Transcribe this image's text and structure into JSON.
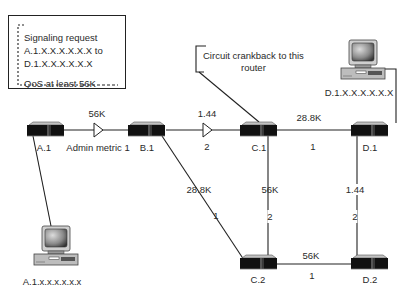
{
  "signal_box": {
    "line1": "Signaling request",
    "line2": "A.1.X.X.X.X.X.X to",
    "line3": "D.1.X.X.X.X.X.X",
    "line4": "QoS at least 56K"
  },
  "callout": {
    "line1": "Circuit crankback to this",
    "line2": "router"
  },
  "routers": [
    {
      "id": "A.1",
      "label": "A.1"
    },
    {
      "id": "B.1",
      "label": "B.1"
    },
    {
      "id": "C.1",
      "label": "C.1"
    },
    {
      "id": "D.1",
      "label": "D.1"
    },
    {
      "id": "C.2",
      "label": "C.2"
    },
    {
      "id": "D.2",
      "label": "D.2"
    }
  ],
  "hosts": [
    {
      "id": "host-d1",
      "label": "D.1.X.X.X.X.X.X",
      "attached_to": "D.1"
    },
    {
      "id": "host-a1",
      "label": "A.1.x.x.x.x.x.x",
      "attached_to": "A.1"
    }
  ],
  "links": [
    {
      "from": "A.1",
      "to": "B.1",
      "bandwidth": "56K",
      "metric": "Admin metric 1"
    },
    {
      "from": "B.1",
      "to": "C.1",
      "bandwidth": "1.44",
      "metric": "2"
    },
    {
      "from": "C.1",
      "to": "D.1",
      "bandwidth": "28.8K",
      "metric": "1"
    },
    {
      "from": "B.1",
      "to": "C.2",
      "bandwidth": "28.8K",
      "metric": "1"
    },
    {
      "from": "C.1",
      "to": "C.2",
      "bandwidth": "56K",
      "metric": "2"
    },
    {
      "from": "D.1",
      "to": "D.2",
      "bandwidth": "1.44",
      "metric": "2"
    },
    {
      "from": "C.2",
      "to": "D.2",
      "bandwidth": "56K",
      "metric": "1"
    }
  ],
  "colors": {
    "line": "#222222",
    "router_body": "#111111",
    "router_top": "#b5b5b5",
    "background": "#ffffff"
  }
}
